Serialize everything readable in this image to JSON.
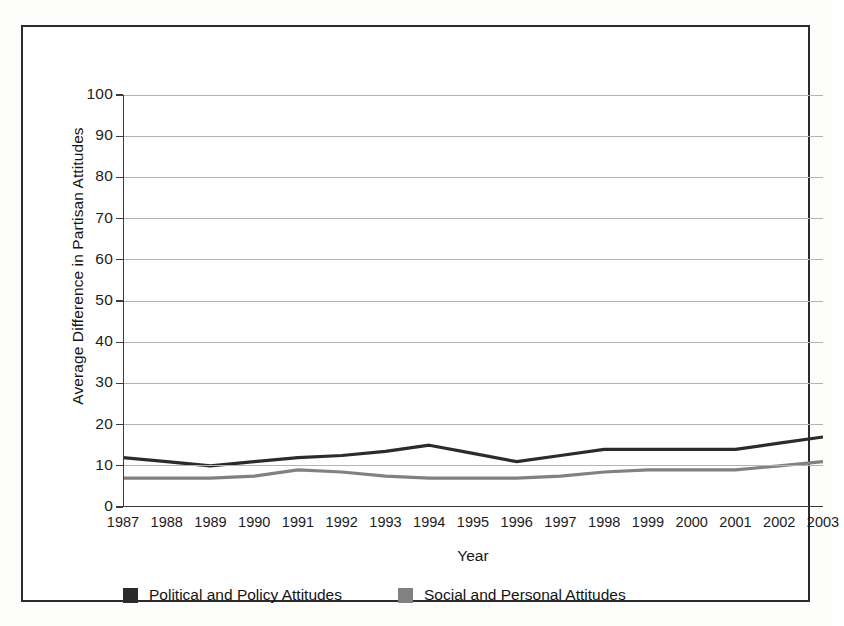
{
  "chart_data": {
    "type": "line",
    "title": "",
    "xlabel": "Year",
    "ylabel": "Average  Difference in Partisan Attitudes",
    "categories": [
      "1987",
      "1988",
      "1989",
      "1990",
      "1991",
      "1992",
      "1993",
      "1994",
      "1995",
      "1996",
      "1997",
      "1998",
      "1999",
      "2000",
      "2001",
      "2002",
      "2003"
    ],
    "ylim": [
      0,
      100
    ],
    "yticks": [
      0,
      10,
      20,
      30,
      40,
      50,
      60,
      70,
      80,
      90,
      100
    ],
    "ytick_labels": [
      "0",
      "10",
      "20",
      "30",
      "40",
      "50",
      "60",
      "70",
      "80",
      "90",
      "100"
    ],
    "grid": true,
    "legend_position": "bottom-left",
    "series": [
      {
        "name": "Political and Policy Attitudes",
        "color": "#2b2b2b",
        "values": [
          12,
          11,
          10,
          11,
          12,
          12.5,
          13.5,
          15,
          13,
          11,
          12.5,
          14,
          14,
          14,
          14,
          15.5,
          17
        ]
      },
      {
        "name": "Social and Personal Attitudes",
        "color": "#818181",
        "values": [
          7,
          7,
          7,
          7.5,
          9,
          8.5,
          7.5,
          7,
          7,
          7,
          7.5,
          8.5,
          9,
          9,
          9,
          10,
          11
        ]
      }
    ]
  },
  "axes": {
    "y_title": "Average  Difference in Partisan Attitudes",
    "x_title": "Year"
  },
  "legend": {
    "entries": [
      {
        "label": "Political and Policy Attitudes",
        "color": "#2b2b2b"
      },
      {
        "label": "Social and Personal Attitudes",
        "color": "#818181"
      }
    ]
  },
  "colors": {
    "frame": "#2b2b2b",
    "axis": "#3a3a3a",
    "grid": "#b4b4b4",
    "series_dark": "#2b2b2b",
    "series_gray": "#818181",
    "background": "#ffffff"
  }
}
